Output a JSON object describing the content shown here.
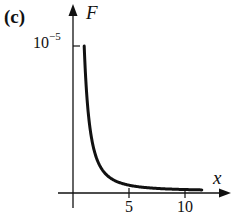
{
  "chart_data": {
    "type": "line",
    "title": "",
    "panel_label": "(c)",
    "xlabel": "x",
    "ylabel": "F",
    "x_ticks": [
      5,
      10
    ],
    "x_tick_labels": [
      "5",
      "10"
    ],
    "y_ticks": [
      1e-05
    ],
    "y_tick_labels": [
      "10^-5"
    ],
    "y_tick_label_base": "10",
    "y_tick_label_exp": "−5",
    "xlim": [
      0,
      12
    ],
    "ylim": [
      0,
      1.2e-05
    ],
    "grid": false,
    "legend": null,
    "series": [
      {
        "name": "F",
        "formula": "F = 1e-5 / x^2",
        "x": [
          1,
          1.25,
          1.5,
          2,
          2.5,
          3,
          4,
          5,
          6,
          7,
          8,
          9,
          10,
          11,
          11.5
        ],
        "y": [
          1e-05,
          6.4e-06,
          4.44e-06,
          2.5e-06,
          1.6e-06,
          1.11e-06,
          6.25e-07,
          4e-07,
          2.78e-07,
          2.04e-07,
          1.56e-07,
          1.23e-07,
          1e-07,
          8.3e-08,
          7.6e-08
        ]
      }
    ]
  }
}
